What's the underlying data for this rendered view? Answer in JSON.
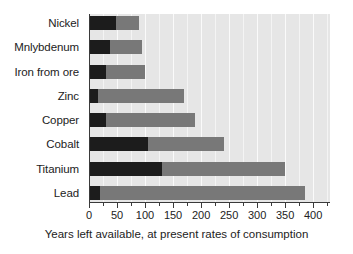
{
  "chart_data": {
    "type": "bar",
    "orientation": "horizontal",
    "title": "",
    "xlabel": "Years left available, at present rates of consumption",
    "ylabel": "",
    "xlim": [
      0,
      430
    ],
    "xticks": [
      0,
      50,
      100,
      150,
      200,
      250,
      300,
      350,
      400
    ],
    "xtick_labels": [
      "0",
      "50",
      "100",
      "150",
      "200",
      "250",
      "300",
      "350",
      "400"
    ],
    "minor_ticks": [
      25,
      75,
      125,
      175,
      225,
      275,
      325,
      375,
      425
    ],
    "grid": true,
    "legend": "none",
    "stacked": true,
    "categories": [
      "Nickel",
      "Mnlybdenum",
      "Iron from ore",
      "Zinc",
      "Copper",
      "Cobalt",
      "Titanium",
      "Lead"
    ],
    "series": [
      {
        "name": "dark-segment",
        "color": "#1c1c1c",
        "values": [
          48,
          38,
          30,
          16,
          30,
          105,
          130,
          20
        ]
      },
      {
        "name": "light-segment",
        "color": "#787878",
        "values": [
          42,
          57,
          70,
          154,
          160,
          135,
          220,
          365
        ]
      }
    ],
    "totals": [
      90,
      95,
      100,
      170,
      190,
      240,
      350,
      385
    ],
    "plot_background": "#e6e6e6",
    "gridline_color": "#f4f4f4",
    "axis_color": "#3a3a3a",
    "page_background": "#ffffff"
  }
}
